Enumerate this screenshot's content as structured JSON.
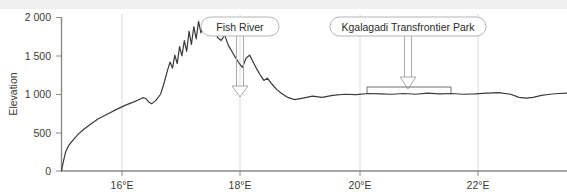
{
  "chart_data": {
    "type": "line",
    "title": "",
    "subtitle": "",
    "xlabel": "",
    "ylabel": "Elevation",
    "grid": "vertical gridlines at x tick positions only",
    "legend": "none",
    "xlim": [
      14.63,
      23.15
    ],
    "ylim": [
      0,
      2100
    ],
    "yticks": [
      0,
      500,
      1000,
      1500,
      2000
    ],
    "ytick_labels": [
      "0",
      "500",
      "1 000",
      "1 500",
      "2 000"
    ],
    "xticks": [
      16,
      18,
      20,
      22
    ],
    "xtick_labels": [
      "16°E",
      "18°E",
      "20°E",
      "22°E"
    ],
    "series": [
      {
        "name": "Elevation profile",
        "color": "#3a3a3a",
        "x": [
          14.63,
          14.66,
          14.7,
          14.75,
          14.82,
          14.9,
          15.0,
          15.12,
          15.25,
          15.4,
          15.55,
          15.7,
          15.85,
          15.95,
          16.0,
          16.05,
          16.1,
          16.15,
          16.22,
          16.3,
          16.36,
          16.42,
          16.46,
          16.5,
          16.54,
          16.58,
          16.62,
          16.66,
          16.7,
          16.74,
          16.78,
          16.82,
          16.86,
          16.9,
          16.94,
          16.98,
          17.02,
          17.06,
          17.1,
          17.14,
          17.18,
          17.22,
          17.26,
          17.32,
          17.38,
          17.44,
          17.5,
          17.56,
          17.62,
          17.68,
          17.74,
          17.8,
          17.86,
          17.92,
          17.98,
          18.04,
          18.1,
          18.18,
          18.26,
          18.34,
          18.44,
          18.56,
          18.7,
          18.86,
          19.02,
          19.2,
          19.4,
          19.6,
          19.8,
          20.0,
          20.2,
          20.4,
          20.6,
          20.8,
          21.0,
          21.2,
          21.4,
          21.6,
          21.8,
          22.0,
          22.2,
          22.34,
          22.46,
          22.58,
          22.72,
          22.86,
          23.0,
          23.15
        ],
        "y": [
          0,
          120,
          250,
          330,
          400,
          470,
          540,
          610,
          680,
          740,
          800,
          855,
          900,
          935,
          955,
          945,
          900,
          875,
          920,
          1000,
          1150,
          1320,
          1420,
          1340,
          1510,
          1400,
          1620,
          1500,
          1700,
          1560,
          1820,
          1650,
          1880,
          1720,
          1950,
          1800,
          1880,
          1820,
          1930,
          1860,
          1770,
          1830,
          1740,
          1700,
          1770,
          1640,
          1560,
          1480,
          1410,
          1350,
          1470,
          1510,
          1420,
          1330,
          1250,
          1180,
          1210,
          1130,
          1060,
          1010,
          960,
          930,
          950,
          975,
          960,
          985,
          1000,
          995,
          1010,
          1005,
          1000,
          1010,
          1000,
          1015,
          1005,
          1010,
          1000,
          1005,
          1015,
          1020,
          1000,
          960,
          950,
          960,
          985,
          1000,
          1010,
          1015
        ]
      }
    ],
    "annotations": [
      {
        "id": "fish-river",
        "label": "Fish River",
        "type": "callout-arrow",
        "arrow_x": 17.98,
        "arrow_target_y": 960,
        "label_center_x": 17.98,
        "label_top_y_px": 17
      },
      {
        "id": "kgalagadi-transfrontier-park",
        "label": "Kgalagadi Transfrontier Park",
        "type": "callout-arrow-with-span-bracket",
        "arrow_x": 20.08,
        "arrow_target_y": 1005,
        "label_center_x": 20.08,
        "label_top_y_px": 17,
        "bracket_x_start": 19.96,
        "bracket_x_end": 21.4
      }
    ]
  },
  "axis": {
    "y_title": "Elevation",
    "y_tick_labels": [
      "2 000",
      "1 500",
      "1 000",
      "500",
      "0"
    ],
    "x_tick_labels": [
      "16°E",
      "18°E",
      "20°E",
      "22°E"
    ]
  },
  "callouts": {
    "fish_river": "Fish River",
    "kgalagadi": "Kgalagadi Transfrontier Park"
  },
  "colors": {
    "line": "#3a3a3a",
    "axis": "#8a8a8a",
    "gridline": "#dcdcdc",
    "callout_border": "#b5b5b5",
    "arrow_stroke": "#a9a9a9",
    "text": "#3b3b3b",
    "top_band": "#f0f0f0"
  }
}
